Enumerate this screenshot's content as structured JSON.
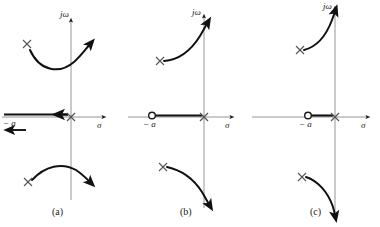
{
  "figure": {
    "background": "#ffffff",
    "ink": "#1a1a1a",
    "axis_color": "#8a8a8a",
    "locus_color": "#111111"
  },
  "panels": [
    {
      "id": "a",
      "caption": "(a)",
      "imaginary_axis_label": "jω",
      "real_axis_label": "σ",
      "open_loop_zero_label": "− a",
      "has_zero_marker": false,
      "poles": [
        {
          "name": "origin-pole",
          "marker": "×"
        },
        {
          "name": "upper-complex-pole",
          "marker": "×"
        },
        {
          "name": "lower-complex-pole",
          "marker": "×"
        }
      ],
      "real_axis_locus": "segment from minus infinity to the origin pole, travelling left",
      "branch_directions": [
        "upper branch sweeps right and crosses the jω axis upward",
        "lower branch sweeps right and crosses the jω axis downward",
        "real axis branch travels toward minus infinity"
      ]
    },
    {
      "id": "b",
      "caption": "(b)",
      "imaginary_axis_label": "jω",
      "real_axis_label": "σ",
      "open_loop_zero_label": "− a",
      "has_zero_marker": true,
      "poles": [
        {
          "name": "origin-pole",
          "marker": "×"
        },
        {
          "name": "upper-complex-pole",
          "marker": "×"
        },
        {
          "name": "lower-complex-pole",
          "marker": "×"
        }
      ],
      "real_axis_locus": "segment between the zero at minus a and the origin pole",
      "branch_directions": [
        "upper branch curves up and to the right along the jω axis",
        "lower branch curves down and to the right along the jω axis"
      ]
    },
    {
      "id": "c",
      "caption": "(c)",
      "imaginary_axis_label": "jω",
      "real_axis_label": "σ",
      "open_loop_zero_label": "− a",
      "has_zero_marker": true,
      "poles": [
        {
          "name": "origin-pole",
          "marker": "×"
        },
        {
          "name": "upper-complex-pole",
          "marker": "×"
        },
        {
          "name": "lower-complex-pole",
          "marker": "×"
        }
      ],
      "real_axis_locus": "short segment between the zero at minus a and the origin pole",
      "branch_directions": [
        "upper branch rises steeply up and to the right toward the jω axis",
        "lower branch falls steeply down and to the right toward the jω axis"
      ]
    }
  ]
}
